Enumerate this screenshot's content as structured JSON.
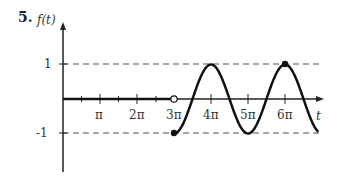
{
  "problem": {
    "number": "5."
  },
  "chart_data": {
    "type": "line",
    "title": "",
    "xlabel": "t",
    "ylabel": "f(t)",
    "xticks": [
      {
        "value": 3.14159,
        "label": "π"
      },
      {
        "value": 6.28319,
        "label": "2π"
      },
      {
        "value": 9.42478,
        "label": "3π"
      },
      {
        "value": 12.56637,
        "label": "4π"
      },
      {
        "value": 15.70796,
        "label": "5π"
      },
      {
        "value": 18.84956,
        "label": "6π"
      }
    ],
    "minor_xticks_every": "π/2",
    "yticks": [
      {
        "value": 1,
        "label": "1"
      },
      {
        "value": -1,
        "label": "-1"
      }
    ],
    "reference_lines": [
      {
        "y": 1,
        "style": "dashed"
      },
      {
        "y": -1,
        "style": "dashed"
      }
    ],
    "series": [
      {
        "name": "f(t)=0 for t<3π",
        "piecewise": "0",
        "x_range": [
          0,
          9.42478
        ],
        "y": 0,
        "end_marker": "open-circle"
      },
      {
        "name": "f(t)=cos(t) for t≥3π",
        "piecewise": "cos(t)",
        "x_range": [
          9.42478,
          21.7
        ],
        "start_marker": "filled-circle",
        "points": [
          {
            "x": 9.42478,
            "y": -1
          },
          {
            "x": 12.56637,
            "y": 1
          },
          {
            "x": 15.70796,
            "y": -1
          },
          {
            "x": 18.84956,
            "y": 1
          }
        ]
      }
    ],
    "markers": [
      {
        "x": 9.42478,
        "y": 0,
        "type": "open-circle"
      },
      {
        "x": 9.42478,
        "y": -1,
        "type": "filled-circle"
      },
      {
        "x": 18.84956,
        "y": 1,
        "type": "filled-circle"
      }
    ],
    "grid": false
  },
  "labels": {
    "y_axis": "f(t)",
    "x_axis": "t",
    "y_one": "1",
    "y_neg_one": "-1",
    "pi": "π",
    "two_pi": "2π",
    "three_pi": "3π",
    "four_pi": "4π",
    "five_pi": "5π",
    "six_pi": "6π"
  }
}
